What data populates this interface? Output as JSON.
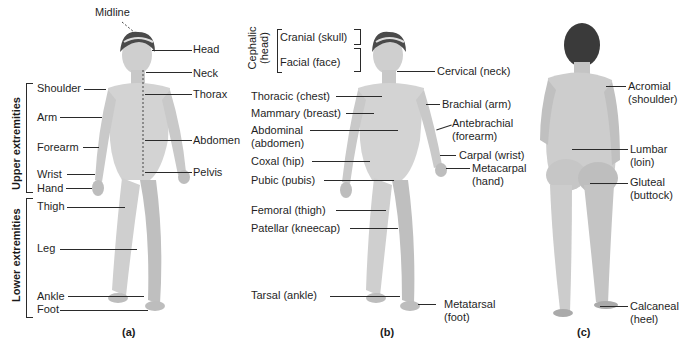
{
  "figure": {
    "panels": [
      {
        "caption": "(a)",
        "view": "anterior",
        "midline_label": "Midline",
        "group_labels": {
          "upper": "Upper extremities",
          "lower": "Lower extremities"
        },
        "left_labels": [
          "Shoulder",
          "Arm",
          "Forearm",
          "Wrist",
          "Hand",
          "Thigh",
          "Leg",
          "Ankle",
          "Foot"
        ],
        "right_labels": [
          "Head",
          "Neck",
          "Thorax",
          "Abdomen",
          "Pelvis"
        ]
      },
      {
        "caption": "(b)",
        "view": "anterior",
        "group_labels": {
          "cephalic": "Cephalic",
          "cephalic_sub": "(head)"
        },
        "head_labels": [
          "Cranial (skull)",
          "Facial (face)"
        ],
        "left_labels": [
          "Thoracic (chest)",
          "Mammary (breast)",
          "Abdominal",
          "(abdomen)",
          "Coxal (hip)",
          "Pubic (pubis)",
          "Femoral (thigh)",
          "Patellar (kneecap)",
          "Tarsal (ankle)"
        ],
        "right_labels": [
          "Cervical (neck)",
          "Brachial (arm)",
          "Antebrachial",
          "(forearm)",
          "Carpal (wrist)",
          "Metacarpal",
          "(hand)",
          "Metatarsal",
          "(foot)"
        ]
      },
      {
        "caption": "(c)",
        "view": "posterior",
        "right_labels": [
          "Acromial",
          "(shoulder)",
          "Lumbar",
          "(loin)",
          "Gluteal",
          "(buttock)",
          "Calcaneal",
          "(heel)"
        ]
      }
    ]
  },
  "colors": {
    "skin": "#d4d4d4",
    "skin_shade": "#a8a8a8",
    "hair": "#3a3a3a",
    "line": "#2a2a2a"
  }
}
